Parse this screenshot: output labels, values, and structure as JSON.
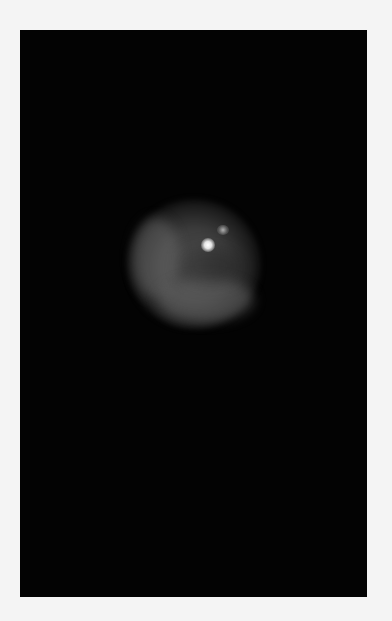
{
  "image": {
    "description": "Fluorescence microscopy image of a single cell nucleus on a black background",
    "background_color": "#f4f4f4",
    "frame_color": "#030303",
    "cell_color": "#5a5a5a",
    "spot_color": "#ffffff"
  }
}
